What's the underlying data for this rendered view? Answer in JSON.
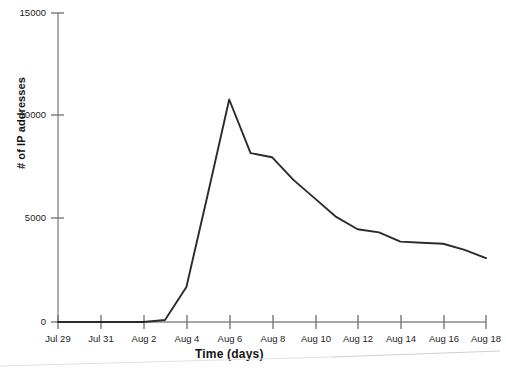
{
  "figure": {
    "background_color": "#ffffff",
    "line_color": "#2b2b2b",
    "axis_color": "#7d7d7d",
    "text_color": "#1a1a1a"
  },
  "chart_data": {
    "type": "line",
    "title": "",
    "xlabel": "Time (days)",
    "ylabel": "# of IP addresses",
    "grid": false,
    "legend": null,
    "ylim": [
      0,
      15000
    ],
    "ytick_values": [
      0,
      5000,
      10000,
      15000
    ],
    "ytick_labels": [
      "0",
      "5000",
      "10000",
      "15000"
    ],
    "xlim": [
      "Jul 29",
      "Aug 18"
    ],
    "xtick_labels": [
      "Jul 29",
      "Jul 31",
      "Aug 2",
      "Aug 4",
      "Aug 6",
      "Aug 8",
      "Aug 10",
      "Aug 12",
      "Aug 14",
      "Aug 16",
      "Aug 18"
    ],
    "x": [
      "Jul 29",
      "Jul 30",
      "Jul 31",
      "Aug 1",
      "Aug 2",
      "Aug 3",
      "Aug 4",
      "Aug 5",
      "Aug 6",
      "Aug 7",
      "Aug 8",
      "Aug 9",
      "Aug 10",
      "Aug 11",
      "Aug 12",
      "Aug 13",
      "Aug 14",
      "Aug 15",
      "Aug 16",
      "Aug 17",
      "Aug 18"
    ],
    "values": [
      0,
      0,
      0,
      0,
      0,
      100,
      1700,
      6200,
      10800,
      8200,
      8000,
      6900,
      6000,
      5100,
      4500,
      4350,
      3900,
      3850,
      3800,
      3500,
      3100
    ],
    "series": [
      {
        "name": "# of IP addresses",
        "values": [
          0,
          0,
          0,
          0,
          0,
          100,
          1700,
          6200,
          10800,
          8200,
          8000,
          6900,
          6000,
          5100,
          4500,
          4350,
          3900,
          3850,
          3800,
          3500,
          3100
        ]
      }
    ],
    "peak": {
      "x": "Aug 6",
      "y": 10800
    }
  },
  "caption": {
    "ghost_text": ""
  }
}
